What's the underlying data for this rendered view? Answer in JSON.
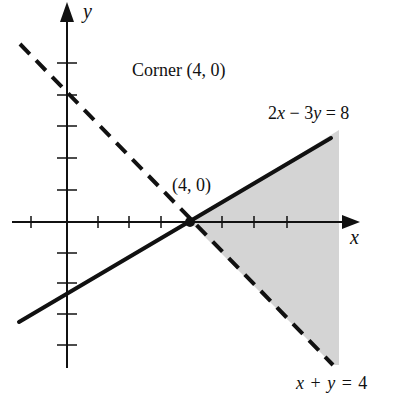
{
  "axes": {
    "x_label": "x",
    "y_label": "y"
  },
  "labels": {
    "corner_note": "Corner (4, 0)",
    "point": "(4, 0)",
    "line1": "2x − 3y = 8",
    "line1_parts": [
      "2",
      "x",
      " − 3",
      "y",
      " = 8"
    ],
    "line2": "x + y = 4",
    "line2_parts": [
      "x",
      " + ",
      "y",
      " = 4"
    ]
  },
  "lines": [
    {
      "equation": "2x - 3y = 8",
      "style": "solid"
    },
    {
      "equation": "x + y = 4",
      "style": "dashed"
    }
  ],
  "region": {
    "description": "shaded region to the right of the corner between the lines",
    "fill": "#d4d4d4"
  },
  "corner_point": {
    "x": 4,
    "y": 0
  }
}
